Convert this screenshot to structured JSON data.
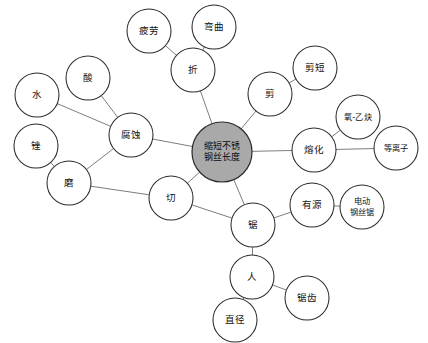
{
  "diagram": {
    "title": "缩短不锈钢丝长度",
    "type": "concept-map",
    "colors": {
      "central_fill": "#a9a9a9",
      "node_fill": "#ffffff",
      "node_stroke": "#2b2b2b",
      "edge_stroke": "#6e6e6e",
      "background": "#ffffff",
      "text": "#111111"
    },
    "nodes": [
      {
        "id": "center",
        "label": "缩短不锈钢丝长度",
        "lines": [
          "缩短不锈",
          "钢丝长度"
        ],
        "cx": 222,
        "cy": 152,
        "r": 30,
        "central": true,
        "size": "central"
      },
      {
        "id": "pilao",
        "label": "疲劳",
        "lines": [
          "疲劳"
        ],
        "cx": 149,
        "cy": 31,
        "r": 22,
        "central": false,
        "size": "normal"
      },
      {
        "id": "wanqu",
        "label": "弯曲",
        "lines": [
          "弯曲"
        ],
        "cx": 214,
        "cy": 27,
        "r": 22,
        "central": false,
        "size": "normal"
      },
      {
        "id": "zhe",
        "label": "折",
        "lines": [
          "折"
        ],
        "cx": 193,
        "cy": 70,
        "r": 22,
        "central": false,
        "size": "normal"
      },
      {
        "id": "jian",
        "label": "剪",
        "lines": [
          "剪"
        ],
        "cx": 270,
        "cy": 94,
        "r": 22,
        "central": false,
        "size": "normal"
      },
      {
        "id": "jianduan",
        "label": "剪短",
        "lines": [
          "剪短"
        ],
        "cx": 315,
        "cy": 68,
        "r": 22,
        "central": false,
        "size": "normal"
      },
      {
        "id": "shui",
        "label": "水",
        "lines": [
          "水"
        ],
        "cx": 37,
        "cy": 95,
        "r": 22,
        "central": false,
        "size": "normal"
      },
      {
        "id": "suan",
        "label": "酸",
        "lines": [
          "酸"
        ],
        "cx": 88,
        "cy": 78,
        "r": 22,
        "central": false,
        "size": "normal"
      },
      {
        "id": "fushi",
        "label": "腐蚀",
        "lines": [
          "腐蚀"
        ],
        "cx": 131,
        "cy": 135,
        "r": 22,
        "central": false,
        "size": "normal"
      },
      {
        "id": "cuo",
        "label": "锉",
        "lines": [
          "锉"
        ],
        "cx": 36,
        "cy": 146,
        "r": 22,
        "central": false,
        "size": "normal"
      },
      {
        "id": "mo",
        "label": "磨",
        "lines": [
          "磨"
        ],
        "cx": 69,
        "cy": 183,
        "r": 22,
        "central": false,
        "size": "normal"
      },
      {
        "id": "qie",
        "label": "切",
        "lines": [
          "切"
        ],
        "cx": 171,
        "cy": 198,
        "r": 22,
        "central": false,
        "size": "normal"
      },
      {
        "id": "ronghua",
        "label": "熔化",
        "lines": [
          "熔化"
        ],
        "cx": 314,
        "cy": 150,
        "r": 22,
        "central": false,
        "size": "normal"
      },
      {
        "id": "yangyiquea",
        "label": "氧-乙炔",
        "lines": [
          "氧-乙炔"
        ],
        "cx": 358,
        "cy": 117,
        "r": 22,
        "central": false,
        "size": "small"
      },
      {
        "id": "dengliziiii",
        "label": "等离子",
        "lines": [
          "等离子"
        ],
        "cx": 396,
        "cy": 148,
        "r": 22,
        "central": false,
        "size": "small"
      },
      {
        "id": "ju",
        "label": "锯",
        "lines": [
          "锯"
        ],
        "cx": 253,
        "cy": 225,
        "r": 22,
        "central": false,
        "size": "normal"
      },
      {
        "id": "youyuan",
        "label": "有源",
        "lines": [
          "有源"
        ],
        "cx": 312,
        "cy": 205,
        "r": 22,
        "central": false,
        "size": "normal"
      },
      {
        "id": "dianddongju",
        "label": "电动钢丝锯",
        "lines": [
          "电动",
          "钢丝锯"
        ],
        "cx": 362,
        "cy": 207,
        "r": 22,
        "central": false,
        "size": "small"
      },
      {
        "id": "ren",
        "label": "人",
        "lines": [
          "人"
        ],
        "cx": 252,
        "cy": 277,
        "r": 22,
        "central": false,
        "size": "normal"
      },
      {
        "id": "juchi",
        "label": "锯齿",
        "lines": [
          "锯齿"
        ],
        "cx": 307,
        "cy": 298,
        "r": 22,
        "central": false,
        "size": "normal"
      },
      {
        "id": "zhijing",
        "label": "直径",
        "lines": [
          "直径"
        ],
        "cx": 235,
        "cy": 320,
        "r": 22,
        "central": false,
        "size": "normal"
      }
    ],
    "edges": [
      {
        "from": "zhe",
        "to": "pilao"
      },
      {
        "from": "zhe",
        "to": "wanqu"
      },
      {
        "from": "zhe",
        "to": "center"
      },
      {
        "from": "jian",
        "to": "jianduan"
      },
      {
        "from": "jian",
        "to": "center"
      },
      {
        "from": "center",
        "to": "fushi"
      },
      {
        "from": "fushi",
        "to": "shui"
      },
      {
        "from": "fushi",
        "to": "suan"
      },
      {
        "from": "fushi",
        "to": "mo"
      },
      {
        "from": "mo",
        "to": "cuo"
      },
      {
        "from": "mo",
        "to": "qie"
      },
      {
        "from": "qie",
        "to": "center"
      },
      {
        "from": "qie",
        "to": "ju"
      },
      {
        "from": "center",
        "to": "ronghua"
      },
      {
        "from": "ronghua",
        "to": "yangyiquea"
      },
      {
        "from": "ronghua",
        "to": "dengliziiii"
      },
      {
        "from": "center",
        "to": "ju"
      },
      {
        "from": "ju",
        "to": "youyuan"
      },
      {
        "from": "youyuan",
        "to": "dianddongju"
      },
      {
        "from": "ju",
        "to": "ren"
      },
      {
        "from": "ren",
        "to": "juchi"
      },
      {
        "from": "ren",
        "to": "zhijing"
      }
    ]
  }
}
